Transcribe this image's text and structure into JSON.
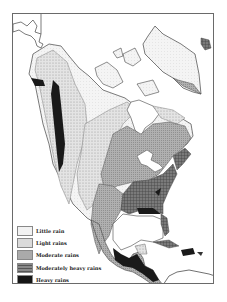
{
  "map": {
    "subject": "Annual rainfall of North America",
    "colors": {
      "little": "#efefef",
      "light": "#d6d6d6",
      "moderate": "#a8a8a8",
      "moderately_heavy": "#6e6e6e",
      "heavy": "#1a1a1a",
      "water": "#ffffff",
      "border": "#555555"
    }
  },
  "legend": {
    "items": [
      {
        "label": "Little rain",
        "key": "little"
      },
      {
        "label": "Light rains",
        "key": "light"
      },
      {
        "label": "Moderate rains",
        "key": "moderate"
      },
      {
        "label": "Moderately heavy rains",
        "key": "moderately_heavy"
      },
      {
        "label": "Heavy rains",
        "key": "heavy"
      }
    ]
  }
}
